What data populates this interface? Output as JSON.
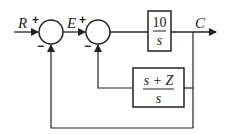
{
  "diagram": {
    "type": "feedback block diagram",
    "signals": {
      "input": "R",
      "error": "E",
      "output": "C"
    },
    "summing_junctions": [
      {
        "id": "sum1",
        "signs": {
          "top_left": "+",
          "bottom": "−"
        }
      },
      {
        "id": "sum2",
        "signs": {
          "top_left": "+",
          "bottom": "−"
        }
      }
    ],
    "blocks": [
      {
        "id": "forward",
        "numerator": "10",
        "denominator": "s"
      },
      {
        "id": "inner_feedback",
        "numerator": "s + Z",
        "denominator": "s"
      }
    ],
    "colors": {
      "line": "#222222",
      "background": "#ffffff"
    }
  }
}
